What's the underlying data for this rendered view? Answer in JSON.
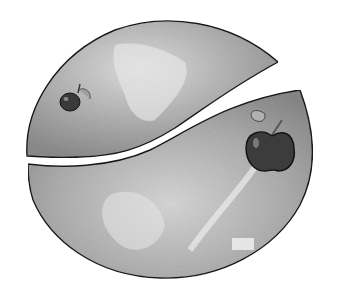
{
  "illustration": {
    "subject": "circle split into two pieces with apples",
    "style": "grayscale pencil drawing",
    "colors": {
      "background": "#ffffff",
      "outline": "#1a1a1a",
      "fill_light": "#d4d4d4",
      "fill_mid": "#a8a8a8",
      "fill_dark": "#7a7a7a",
      "apple": "#3a3a3a",
      "leaf": "#9a9a9a"
    },
    "elements": [
      {
        "name": "upper-piece",
        "description": "upper circle segment"
      },
      {
        "name": "lower-piece",
        "description": "lower circle segment"
      },
      {
        "name": "small-apple",
        "description": "small apple on upper piece"
      },
      {
        "name": "large-apple",
        "description": "larger apple on lower piece"
      }
    ]
  }
}
